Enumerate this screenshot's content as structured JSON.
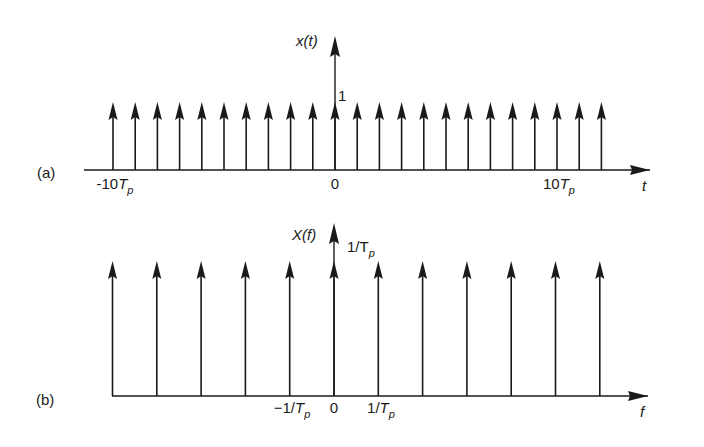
{
  "figure": {
    "background": "#ffffff",
    "ink_color": "#1a1a1a",
    "panels": [
      {
        "id": "a",
        "panel_label": "(a)",
        "y_axis_label": "x(t)",
        "x_axis_label": "t",
        "amplitude_label": "1",
        "tick_labels": [
          {
            "text": "-10T",
            "sub": "p",
            "x": 113
          },
          {
            "text": "0",
            "sub": "",
            "x": 335
          },
          {
            "text": "10T",
            "sub": "p",
            "x": 557
          }
        ]
      },
      {
        "id": "b",
        "panel_label": "(b)",
        "y_axis_label": "X(f)",
        "x_axis_label": "f",
        "amplitude_label": "1/T",
        "amplitude_sub": "p",
        "tick_labels": [
          {
            "text": "−1/T",
            "sub": "p",
            "x": 290
          },
          {
            "text": "0",
            "sub": "",
            "x": 334
          },
          {
            "text": "1/T",
            "sub": "p",
            "x": 379
          }
        ]
      }
    ]
  },
  "chart_data": [
    {
      "type": "stem",
      "title": "(a) Periodic impulse train x(t)",
      "xlabel": "t",
      "ylabel": "x(t)",
      "x_units": "T_p",
      "x": [
        -10,
        -9,
        -8,
        -7,
        -6,
        -5,
        -4,
        -3,
        -2,
        -1,
        0,
        1,
        2,
        3,
        4,
        5,
        6,
        7,
        8,
        9,
        10,
        11,
        12
      ],
      "values": [
        1,
        1,
        1,
        1,
        1,
        1,
        1,
        1,
        1,
        1,
        1,
        1,
        1,
        1,
        1,
        1,
        1,
        1,
        1,
        1,
        1,
        1,
        1
      ],
      "tick_labels": [
        "-10T_p",
        "0",
        "10T_p"
      ],
      "amplitude_label": "1",
      "grid": false
    },
    {
      "type": "stem",
      "title": "(b) Spectrum X(f)",
      "xlabel": "f",
      "ylabel": "X(f)",
      "x_units": "1/T_p",
      "x": [
        -5,
        -4,
        -3,
        -2,
        -1,
        0,
        1,
        2,
        3,
        4,
        5,
        6
      ],
      "values": [
        1,
        1,
        1,
        1,
        1,
        1,
        1,
        1,
        1,
        1,
        1,
        1
      ],
      "tick_labels": [
        "-1/T_p",
        "0",
        "1/T_p"
      ],
      "amplitude_label": "1/T_p",
      "grid": false
    }
  ]
}
